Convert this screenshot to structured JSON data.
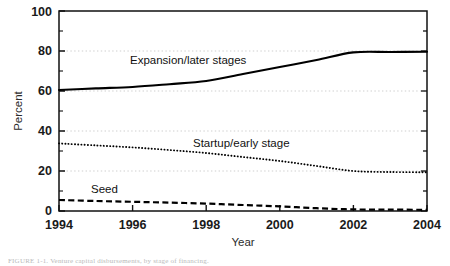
{
  "chart_data": {
    "type": "line",
    "title": "",
    "xlabel": "Year",
    "ylabel": "Percent",
    "xlim": [
      1994,
      2004
    ],
    "ylim": [
      0,
      100
    ],
    "xticks": [
      1994,
      1996,
      1998,
      2000,
      2002,
      2004
    ],
    "xtick_labels": [
      "1994",
      "1996",
      "1998",
      "2000",
      "2002",
      "2004"
    ],
    "yticks": [
      0,
      20,
      40,
      60,
      80,
      100
    ],
    "ytick_labels": [
      "0",
      "20",
      "40",
      "60",
      "80",
      "100"
    ],
    "yminorticks": [
      10,
      30,
      50,
      70,
      90
    ],
    "grid": "horizontal-dotted-at-major-y",
    "legend_position": "inline-annotations",
    "x": [
      1994,
      1995,
      1996,
      1997,
      1998,
      1999,
      2000,
      2001,
      2002,
      2003,
      2004
    ],
    "series": [
      {
        "name": "Expansion/later stages",
        "style": "solid",
        "color": "#000000",
        "values": [
          60.5,
          61.3,
          62.0,
          63.4,
          65.0,
          68.5,
          72.0,
          75.5,
          79.3,
          79.5,
          79.6
        ]
      },
      {
        "name": "Startup/early stage",
        "style": "dotted",
        "color": "#000000",
        "values": [
          33.8,
          32.8,
          31.8,
          30.5,
          29.0,
          27.0,
          25.0,
          22.5,
          20.0,
          19.5,
          19.4
        ]
      },
      {
        "name": "Seed",
        "style": "dashed",
        "color": "#000000",
        "values": [
          5.5,
          5.0,
          4.6,
          4.2,
          3.7,
          3.0,
          2.3,
          1.4,
          0.8,
          0.7,
          0.6
        ]
      }
    ],
    "annotations": [
      {
        "text": "Expansion/later stages",
        "x": 1997.0,
        "y": 72.0
      },
      {
        "text": "Startup/early stage",
        "x": 2000.0,
        "y": 35.5
      },
      {
        "text": "Seed",
        "x": 1995.1,
        "y": 10.5
      }
    ]
  },
  "axes": {
    "ylabel": "Percent",
    "xlabel": "Year"
  },
  "labels": {
    "expansion": "Expansion/later stages",
    "startup": "Startup/early stage",
    "seed": "Seed"
  },
  "ytick_0": "0",
  "ytick_20": "20",
  "ytick_40": "40",
  "ytick_60": "60",
  "ytick_80": "80",
  "ytick_100": "100",
  "xtick_1994": "1994",
  "xtick_1996": "1996",
  "xtick_1998": "1998",
  "xtick_2000": "2000",
  "xtick_2002": "2002",
  "xtick_2004": "2004",
  "caption": "FIGURE 1-1. Venture capital disbursements, by stage of financing."
}
